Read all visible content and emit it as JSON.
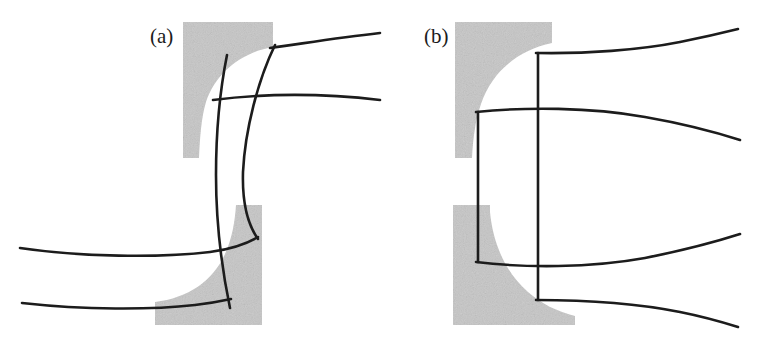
{
  "figure": {
    "type": "line-diagram",
    "background_color": "#ffffff",
    "line_color": "#1c1c1c",
    "fill_color": "#c6c6c6",
    "line_width": 2.6,
    "width": 761,
    "height": 347
  },
  "panels": [
    {
      "id": "a",
      "label": "(a)",
      "label_x": 150,
      "label_y": 43,
      "variant": "pinched",
      "electrodes": [
        {
          "name": "upper-electrode",
          "x": 183,
          "y": 22,
          "right": 273,
          "bottom": 158,
          "corner": "concave-lower-right",
          "fill": "#c6c6c6"
        },
        {
          "name": "lower-electrode",
          "x": 155,
          "y": 205,
          "right": 262,
          "bottom": 325,
          "corner": "concave-upper-left",
          "fill": "#c6c6c6"
        }
      ],
      "field_lines": [
        {
          "name": "inner-field-line",
          "orientation": "vertical",
          "shape": "waisted",
          "waist_x": 216,
          "top_x": 227,
          "bottom_x": 230
        },
        {
          "name": "outer-field-line",
          "orientation": "vertical",
          "shape": "waisted",
          "waist_x": 243,
          "top_x": 275,
          "bottom_x": 258
        },
        {
          "name": "upper-outer-stream-line",
          "orientation": "horizontal",
          "side": "right",
          "y_left": 46,
          "y_right": 33
        },
        {
          "name": "upper-inner-stream-line",
          "orientation": "horizontal",
          "side": "right",
          "y_left": 96,
          "y_right": 100
        },
        {
          "name": "lower-inner-stream-line",
          "orientation": "horizontal",
          "side": "left",
          "y_left": 248,
          "y_right": 230
        },
        {
          "name": "lower-outer-stream-line",
          "orientation": "horizontal",
          "side": "left",
          "y_left": 303,
          "y_right": 297
        }
      ]
    },
    {
      "id": "b",
      "label": "(b)",
      "label_x": 424,
      "label_y": 43,
      "variant": "straight",
      "electrodes": [
        {
          "name": "upper-electrode",
          "x": 455,
          "y": 22,
          "right": 552,
          "bottom": 158,
          "corner": "concave-lower-right",
          "fill": "#c6c6c6"
        },
        {
          "name": "lower-electrode",
          "x": 453,
          "y": 205,
          "right": 575,
          "bottom": 325,
          "corner": "concave-upper-left",
          "fill": "#c6c6c6"
        }
      ],
      "field_lines": [
        {
          "name": "inner-field-line",
          "orientation": "vertical",
          "shape": "straight",
          "x": 478,
          "y_top": 112,
          "y_bottom": 262
        },
        {
          "name": "outer-field-line",
          "orientation": "vertical",
          "shape": "straight",
          "x": 538,
          "y_top": 53,
          "y_bottom": 300
        },
        {
          "name": "upper-outer-stream-line",
          "orientation": "horizontal",
          "side": "right",
          "y_left": 53,
          "y_right": 34
        },
        {
          "name": "upper-inner-stream-line",
          "orientation": "horizontal",
          "side": "right",
          "y_left": 112,
          "y_right": 130
        },
        {
          "name": "lower-inner-stream-line",
          "orientation": "horizontal",
          "side": "right",
          "y_left": 262,
          "y_right": 243
        },
        {
          "name": "lower-outer-stream-line",
          "orientation": "horizontal",
          "side": "right",
          "y_left": 300,
          "y_right": 320
        }
      ]
    }
  ]
}
